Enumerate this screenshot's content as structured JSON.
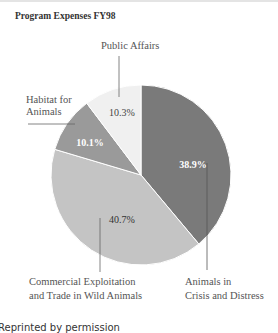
{
  "chart_data": {
    "type": "pie",
    "title": "Program Expenses FY98",
    "categories": [
      "Animals in Crisis and Distress",
      "Commercial Exploitation and Trade in Wild Animals",
      "Habitat for Animals",
      "Public Affairs"
    ],
    "values": [
      38.9,
      40.7,
      10.1,
      10.3
    ],
    "value_labels": [
      "38.9%",
      "40.7%",
      "10.1%",
      "10.3%"
    ],
    "colors": [
      "#7a7a7a",
      "#c4c4c4",
      "#9a9a9a",
      "#f0f0f0"
    ],
    "start_angle": "12 o'clock",
    "direction": "clockwise",
    "label_lines": {
      "animals_in_crisis": [
        "Animals in",
        "Crisis and Distress"
      ],
      "commercial": [
        "Commercial Exploitation",
        "and Trade in Wild Animals"
      ],
      "habitat": [
        "Habitat for",
        "Animals"
      ],
      "public_affairs": [
        "Public Affairs"
      ]
    }
  },
  "footer": "Reprinted by permission"
}
